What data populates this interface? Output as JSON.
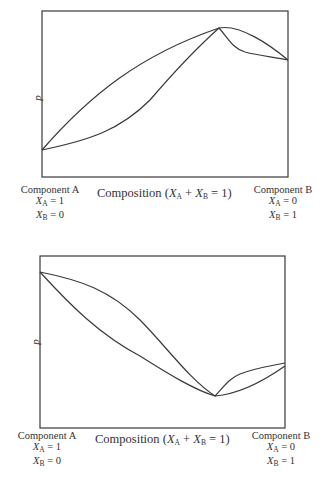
{
  "diagrams": [
    {
      "id": "top",
      "type": "pressure-composition phase diagram (maximum-pressure azeotrope)",
      "y_axis_label": "p",
      "x_axis_label": {
        "prefix": "Composition (",
        "xa": "X",
        "a_sub": "A",
        "plus": " + ",
        "xb": "X",
        "b_sub": "B",
        "suffix": " = 1)"
      },
      "left_label": {
        "title": "Component A",
        "xa_value": "= 1",
        "xb_value": "= 0"
      },
      "right_label": {
        "title": "Component B",
        "xa_value": "= 0",
        "xb_value": "= 1"
      }
    },
    {
      "id": "bottom",
      "type": "pressure-composition phase diagram (minimum-pressure azeotrope)",
      "y_axis_label": "p",
      "x_axis_label": {
        "prefix": "Composition (",
        "xa": "X",
        "a_sub": "A",
        "plus": " + ",
        "xb": "X",
        "b_sub": "B",
        "suffix": " = 1)"
      },
      "left_label": {
        "title": "Component A",
        "xa_value": "= 1",
        "xb_value": "= 0"
      },
      "right_label": {
        "title": "Component B",
        "xa_value": "= 0",
        "xb_value": "= 1"
      }
    }
  ],
  "colors": {
    "line": "#3a3a3a",
    "text": "#333333",
    "background": "#ffffff"
  }
}
